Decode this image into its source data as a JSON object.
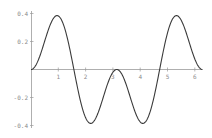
{
  "chart_data": {
    "type": "line",
    "title": "",
    "xlabel": "",
    "ylabel": "",
    "function": "sin(x)^2 * cos(x)",
    "xlim": [
      0,
      6.283
    ],
    "ylim": [
      -0.4,
      0.4
    ],
    "grid": false,
    "legend": null,
    "x_ticks": [
      1,
      2,
      3,
      4,
      5,
      6
    ],
    "x_tick_labels": [
      "1",
      "2",
      "3",
      "4",
      "5",
      "6"
    ],
    "y_ticks": [
      0.4,
      0.2,
      -0.2,
      -0.4
    ],
    "y_tick_labels": [
      "0.4",
      "0.2",
      "-0.2",
      "-0.4"
    ],
    "series": [
      {
        "name": "f(x)",
        "x": [
          0,
          0.5,
          0.955,
          1.2,
          1.571,
          2.0,
          2.186,
          2.6,
          3.142,
          3.6,
          4.097,
          4.5,
          4.712,
          5.0,
          5.328,
          5.8,
          6.283
        ],
        "values": [
          0,
          0.202,
          0.385,
          0.318,
          0,
          -0.344,
          -0.385,
          -0.232,
          0,
          -0.173,
          -0.385,
          -0.207,
          0,
          0.261,
          0.385,
          0.199,
          0
        ]
      }
    ]
  },
  "axes": {
    "origin_label": ""
  }
}
